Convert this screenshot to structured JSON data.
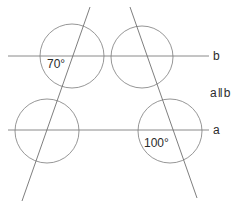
{
  "diagram": {
    "type": "geometry-parallel-lines-transversals",
    "canvas": {
      "width": 240,
      "height": 205,
      "background": "#ffffff"
    },
    "stroke_color": "#808080",
    "text_color": "#2b2b2b",
    "lines": [
      {
        "name": "line-b",
        "label": "b",
        "orientation": "horizontal",
        "x1": 8,
        "y1": 56,
        "x2": 209,
        "y2": 56,
        "label_x": 213,
        "label_y": 50
      },
      {
        "name": "line-a",
        "label": "a",
        "orientation": "horizontal",
        "x1": 8,
        "y1": 130,
        "x2": 209,
        "y2": 130,
        "label_x": 213,
        "label_y": 124
      },
      {
        "name": "transversal-left",
        "label": "",
        "orientation": "oblique",
        "x1": 90,
        "y1": 7,
        "x2": 22,
        "y2": 201,
        "label_x": 0,
        "label_y": 0
      },
      {
        "name": "transversal-right",
        "label": "",
        "orientation": "oblique",
        "x1": 130,
        "y1": 7,
        "x2": 197,
        "y2": 198,
        "label_x": 0,
        "label_y": 0
      }
    ],
    "circles": [
      {
        "name": "circle-top-left",
        "cx": 72,
        "cy": 56,
        "r": 32
      },
      {
        "name": "circle-top-right",
        "cx": 142,
        "cy": 57,
        "r": 31
      },
      {
        "name": "circle-bottom-left",
        "cx": 47,
        "cy": 131,
        "r": 32
      },
      {
        "name": "circle-bottom-right",
        "cx": 170,
        "cy": 131,
        "r": 32
      }
    ],
    "angle_labels": [
      {
        "name": "angle-70",
        "text": "70°",
        "x": 47,
        "y": 58
      },
      {
        "name": "angle-100",
        "text": "100°",
        "x": 144,
        "y": 137
      }
    ],
    "relation": {
      "name": "parallel-relation",
      "left": "a",
      "bars": "‖",
      "right": "b",
      "x": 210,
      "y": 87
    }
  }
}
